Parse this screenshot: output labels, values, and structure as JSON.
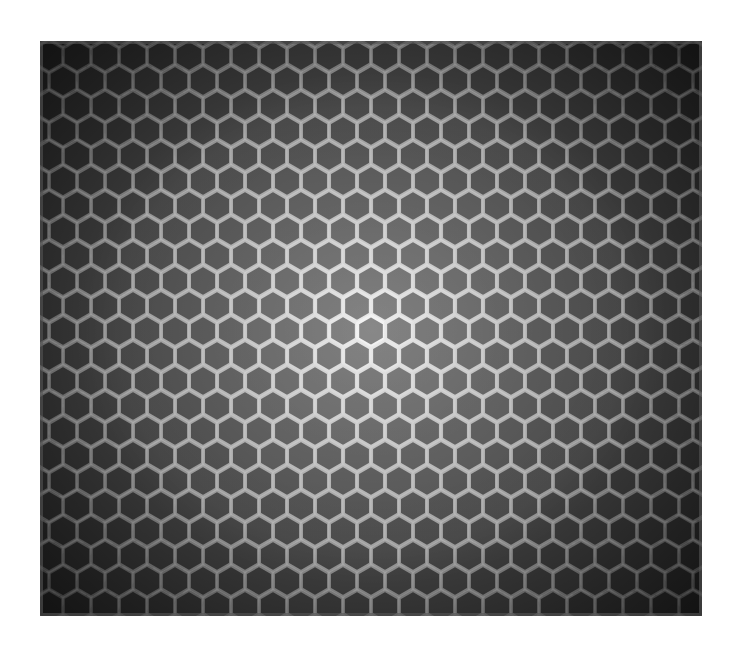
{
  "image": {
    "subject": "honeycomb lattice viewed end-on with perspective",
    "palette": {
      "background": "#ffffff",
      "cell_center": "#6e6e6e",
      "cell_edge": "#262626",
      "wall_center": "#f2f2f2",
      "wall_edge": "#9a9a9a"
    },
    "frame": {
      "x": 40,
      "y": 41,
      "width": 662,
      "height": 575
    },
    "center": {
      "x": 331,
      "y": 290
    },
    "hex": {
      "size": 15.5,
      "col_spacing": 28,
      "row_spacing": 25
    }
  }
}
